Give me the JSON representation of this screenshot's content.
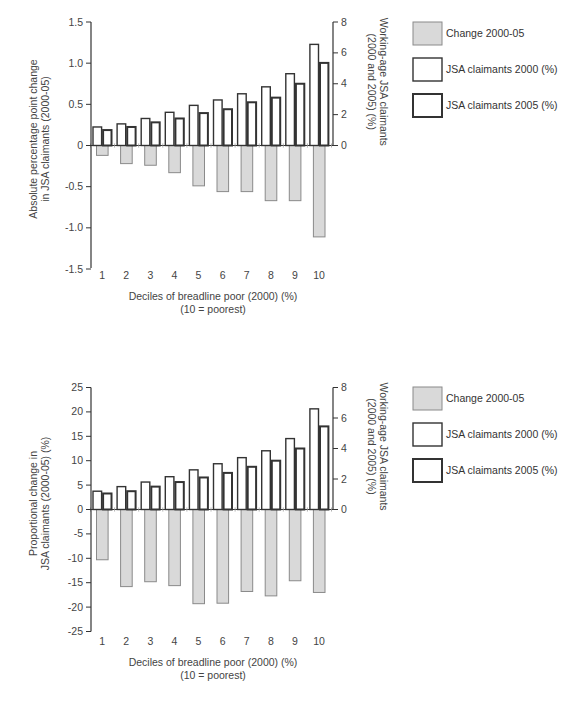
{
  "chart_data": [
    {
      "type": "bar",
      "title": "",
      "categories": [
        "1",
        "2",
        "3",
        "4",
        "5",
        "6",
        "7",
        "8",
        "9",
        "10"
      ],
      "xlabel": "Deciles of breadline poor (2000) (%)",
      "xlabel_sub": "(10 = poorest)",
      "ylabel": "Absolute percentage point change in JSA claimants (2000-05)",
      "ylabel_lines": [
        "Absolute percentage point change",
        "in JSA claimants (2000-05)"
      ],
      "ylim": [
        -1.5,
        1.5
      ],
      "yticks": [
        1.5,
        1.0,
        0.5,
        0,
        -0.5,
        -1.0,
        -1.5
      ],
      "ytick_labels": [
        "1.5",
        "1.0",
        "0.5",
        "0",
        "-0.5",
        "-1.0",
        "-1.5"
      ],
      "y2label": "Working-age JSA claimants (2000 and 2005) (%)",
      "y2label_lines": [
        "Working-age JSA claimants",
        "(2000 and 2005) (%)"
      ],
      "y2lim": [
        -8,
        8
      ],
      "y2ticks": [
        8,
        6,
        4,
        2,
        0
      ],
      "y2tick_labels": [
        "8",
        "6",
        "4",
        "2",
        "0"
      ],
      "grid": false,
      "legend_position": "right",
      "series": [
        {
          "name": "Change 2000-05",
          "axis": "left",
          "style": "grey-fill",
          "values": [
            -0.12,
            -0.22,
            -0.24,
            -0.33,
            -0.49,
            -0.56,
            -0.56,
            -0.67,
            -0.67,
            -1.11
          ]
        },
        {
          "name": "JSA claimants 2000 (%)",
          "axis": "right",
          "style": "thin-outline",
          "values": [
            1.2,
            1.4,
            1.75,
            2.15,
            2.6,
            2.95,
            3.35,
            3.8,
            4.65,
            6.55
          ]
        },
        {
          "name": "JSA claimants 2005 (%)",
          "axis": "right",
          "style": "thick-outline",
          "values": [
            1.0,
            1.2,
            1.5,
            1.75,
            2.1,
            2.35,
            2.8,
            3.1,
            4.0,
            5.35
          ]
        }
      ]
    },
    {
      "type": "bar",
      "title": "",
      "categories": [
        "1",
        "2",
        "3",
        "4",
        "5",
        "6",
        "7",
        "8",
        "9",
        "10"
      ],
      "xlabel": "Deciles of breadline poor (2000) (%)",
      "xlabel_sub": "(10 = poorest)",
      "ylabel": "Proportional change in JSA claimants (2000-05) (%)",
      "ylabel_lines": [
        "Proportional change in",
        "JSA claimants (2000-05) (%)"
      ],
      "ylim": [
        -25,
        25
      ],
      "yticks": [
        25,
        20,
        15,
        10,
        5,
        0,
        -5,
        -10,
        -15,
        -20,
        -25
      ],
      "ytick_labels": [
        "25",
        "20",
        "15",
        "10",
        "5",
        "0",
        "-5",
        "-10",
        "-15",
        "-20",
        "-25"
      ],
      "y2label": "Working-age JSA claimants (2000 and 2005) (%)",
      "y2label_lines": [
        "Working-age JSA claimants",
        "(2000 and 2005) (%)"
      ],
      "y2lim": [
        -8,
        8
      ],
      "y2ticks": [
        8,
        6,
        4,
        2,
        0
      ],
      "y2tick_labels": [
        "8",
        "6",
        "4",
        "2",
        "0"
      ],
      "grid": false,
      "legend_position": "right",
      "series": [
        {
          "name": "Change 2000-05",
          "axis": "left",
          "style": "grey-fill",
          "values": [
            -10.3,
            -15.8,
            -14.8,
            -15.6,
            -19.3,
            -19.2,
            -16.8,
            -17.7,
            -14.6,
            -17.0
          ]
        },
        {
          "name": "JSA claimants 2000 (%)",
          "axis": "right",
          "style": "thin-outline",
          "values": [
            1.2,
            1.5,
            1.8,
            2.15,
            2.6,
            3.0,
            3.4,
            3.85,
            4.65,
            6.6
          ]
        },
        {
          "name": "JSA claimants 2005 (%)",
          "axis": "right",
          "style": "thick-outline",
          "values": [
            1.05,
            1.2,
            1.5,
            1.8,
            2.1,
            2.4,
            2.8,
            3.2,
            4.0,
            5.45
          ]
        }
      ]
    }
  ],
  "layout": [
    {
      "top": 22,
      "zero": 145.5,
      "bottom": 268,
      "xlabel_y": 279,
      "cap1_y": 300,
      "cap2_y": 313,
      "legend_y": [
        22,
        58,
        94
      ]
    },
    {
      "top": 387.5,
      "zero": 509.5,
      "bottom": 631.5,
      "xlabel_y": 645,
      "cap1_y": 666,
      "cap2_y": 679,
      "legend_y": [
        387,
        423,
        459
      ]
    }
  ],
  "colors": {
    "change_fill": "#d9d9d9",
    "change_stroke": "#8a8a8a",
    "outline": "#333333",
    "axis": "#333333"
  }
}
